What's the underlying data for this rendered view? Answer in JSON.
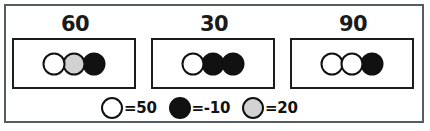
{
  "puzzle": {
    "title": "Counting chips sum puzzle",
    "groups": [
      {
        "name": "group-1",
        "total": "60",
        "chips": [
          {
            "color_name": "white",
            "value": 50
          },
          {
            "color_name": "gray",
            "value": 20
          },
          {
            "color_name": "black",
            "value": -10
          }
        ]
      },
      {
        "name": "group-2",
        "total": "30",
        "chips": [
          {
            "color_name": "white",
            "value": 50
          },
          {
            "color_name": "black",
            "value": -10
          },
          {
            "color_name": "black",
            "value": -10
          }
        ]
      },
      {
        "name": "group-3",
        "total": "90",
        "chips": [
          {
            "color_name": "white",
            "value": 50
          },
          {
            "color_name": "white",
            "value": 50
          },
          {
            "color_name": "black",
            "value": -10
          }
        ]
      }
    ],
    "legend": [
      {
        "color_name": "white",
        "label": "=50"
      },
      {
        "color_name": "black",
        "label": "=-10"
      },
      {
        "color_name": "gray",
        "label": "=20"
      }
    ],
    "colors": {
      "white_chip": "#ffffff",
      "gray_chip": "#d2d2d2",
      "black_chip": "#111111",
      "outline": "#111111",
      "frame": "#555b60",
      "background": "#ffffff"
    }
  }
}
